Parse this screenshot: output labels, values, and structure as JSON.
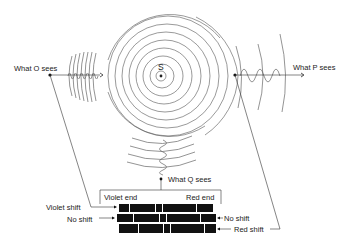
{
  "diagram": {
    "source": {
      "label": "S"
    },
    "observers": {
      "O": {
        "label": "What O sees",
        "position": "left",
        "wave": "compressed (short wavelength)"
      },
      "P": {
        "label": "What P sees",
        "position": "right",
        "wave": "stretched (long wavelength)"
      },
      "Q": {
        "label": "What Q sees",
        "position": "bottom",
        "wave": "unchanged"
      }
    },
    "spectrum": {
      "left_end_label": "Violet end",
      "right_end_label": "Red end",
      "rows": [
        {
          "name": "violet-shift",
          "label": "Violet shift",
          "side": "left"
        },
        {
          "name": "no-shift",
          "label": "No shift",
          "side": "both"
        },
        {
          "name": "red-shift",
          "label": "Red shift",
          "side": "right"
        }
      ],
      "no_shift_right_label": "No shift"
    },
    "colors": {
      "ink": "#111111",
      "wave": "#666666",
      "background": "#ffffff"
    }
  }
}
